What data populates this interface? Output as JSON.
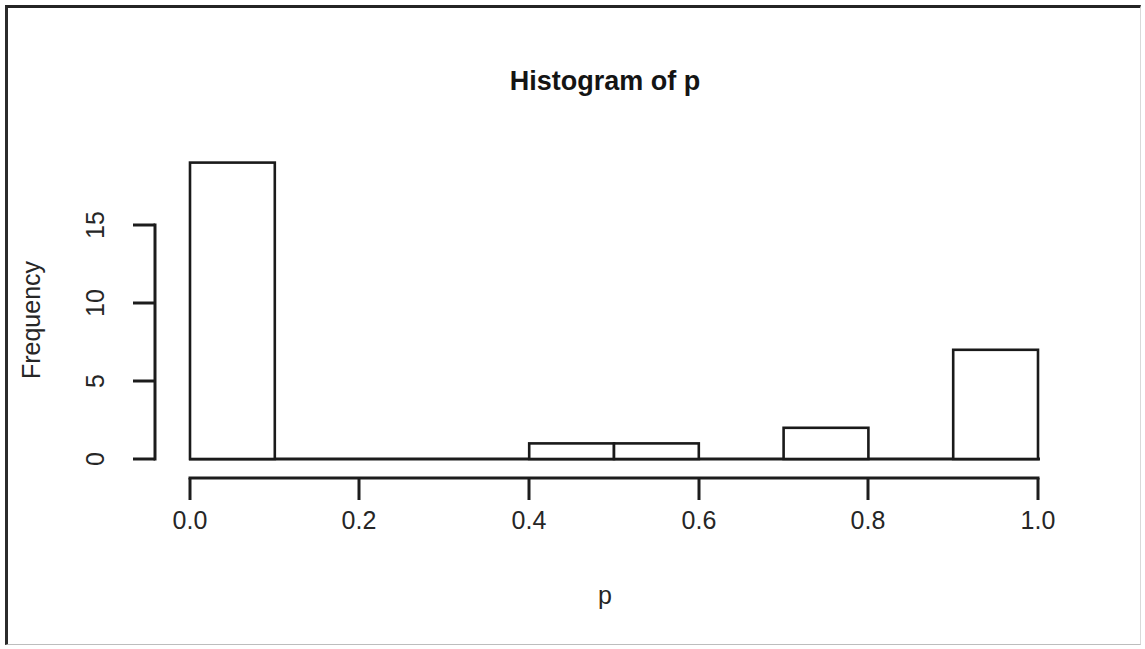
{
  "figure": {
    "title": "Histogram of p",
    "background_color": "#ffffff",
    "ink_color": "#1a1a1a"
  },
  "chart_data": {
    "type": "bar",
    "title": "Histogram of p",
    "xlabel": "p",
    "ylabel": "Frequency",
    "bin_width": 0.1,
    "bin_edges": [
      0.0,
      0.1,
      0.2,
      0.3,
      0.4,
      0.5,
      0.6,
      0.7,
      0.8,
      0.9,
      1.0
    ],
    "categories": [
      "0.0-0.1",
      "0.1-0.2",
      "0.2-0.3",
      "0.3-0.4",
      "0.4-0.5",
      "0.5-0.6",
      "0.6-0.7",
      "0.7-0.8",
      "0.8-0.9",
      "0.9-1.0"
    ],
    "values": [
      19,
      0,
      0,
      0,
      1,
      1,
      0,
      2,
      0,
      7
    ],
    "bars": [
      {
        "x0": 0.0,
        "x1": 0.1,
        "frequency": 19
      },
      {
        "x0": 0.4,
        "x1": 0.5,
        "frequency": 1
      },
      {
        "x0": 0.5,
        "x1": 0.6,
        "frequency": 1
      },
      {
        "x0": 0.7,
        "x1": 0.8,
        "frequency": 2
      },
      {
        "x0": 0.9,
        "x1": 1.0,
        "frequency": 7
      }
    ],
    "xlim": [
      0.0,
      1.0
    ],
    "ylim": [
      0,
      15
    ],
    "xticks": [
      0.0,
      0.2,
      0.4,
      0.6,
      0.8,
      1.0
    ],
    "xticklabels": [
      "0.0",
      "0.2",
      "0.4",
      "0.6",
      "0.8",
      "1.0"
    ],
    "yticks": [
      0,
      5,
      10,
      15
    ],
    "yticklabels": [
      "0",
      "5",
      "10",
      "15"
    ],
    "grid": false,
    "legend": null,
    "total_count": 30
  },
  "axes": {
    "x_tick_labels": [
      "0.0",
      "0.2",
      "0.4",
      "0.6",
      "0.8",
      "1.0"
    ],
    "y_tick_labels": [
      "0",
      "5",
      "10",
      "15"
    ],
    "x_axis_title": "p",
    "y_axis_title": "Frequency"
  }
}
